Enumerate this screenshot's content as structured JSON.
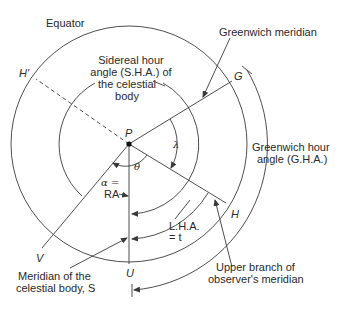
{
  "diagram": {
    "points": {
      "P": "P",
      "G": "G",
      "H": "H",
      "H_prime": "H'",
      "V": "V",
      "U": "U"
    },
    "labels": {
      "equator": "Equator",
      "sha_line1": "Sidereal hour",
      "sha_line2": "angle (S.H.A.) of",
      "sha_line3": "the celestial",
      "sha_line4": "body",
      "greenwich_meridian": "Greenwich meridian",
      "gha_line1": "Greenwich hour",
      "gha_line2": "angle (G.H.A.)",
      "lha_line1": "L.H.A.",
      "lha_line2": "= t",
      "alpha_line1": "α =",
      "alpha_line2": "RA",
      "lambda": "λ",
      "theta": "θ",
      "upper_branch_line1": "Upper branch of",
      "upper_branch_line2": "observer's meridian",
      "body_meridian_line1": "Meridian of the",
      "body_meridian_line2": "celestial body, S"
    },
    "colors": {
      "line": "#3a3a3a",
      "text": "#2a2a2a",
      "background": "#ffffff"
    }
  }
}
